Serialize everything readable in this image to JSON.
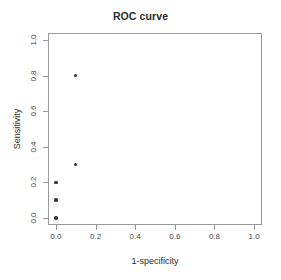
{
  "chart_data": {
    "type": "scatter",
    "title": "ROC curve",
    "xlabel": "1-specificity",
    "ylabel": "Sensitivity",
    "xlim": [
      0.0,
      1.0
    ],
    "ylim": [
      0.0,
      1.0
    ],
    "grid": false,
    "legend": null,
    "xticks": [
      "0.0",
      "0.2",
      "0.4",
      "0.6",
      "0.8",
      "1.0"
    ],
    "xtick_values": [
      0.0,
      0.2,
      0.4,
      0.6,
      0.8,
      1.0
    ],
    "yticks": [
      "0.0",
      "0.2",
      "0.4",
      "0.6",
      "0.8",
      "1.0"
    ],
    "ytick_values": [
      0.0,
      0.2,
      0.4,
      0.6,
      0.8,
      1.0
    ],
    "series": [
      {
        "name": "ROC points",
        "marker": "filled-circle",
        "color": "#333333",
        "x": [
          0.0,
          0.0,
          0.0,
          0.1,
          0.1
        ],
        "y": [
          0.0,
          0.1,
          0.2,
          0.3,
          0.8
        ]
      }
    ]
  }
}
